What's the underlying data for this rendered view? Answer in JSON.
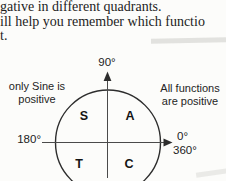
{
  "page": {
    "background": "#fcfcfa",
    "text_color": "#1d1d1d"
  },
  "paragraph": {
    "line1": "gative in different quadrants.",
    "line2": "ill help you remember which functio",
    "line3": "t."
  },
  "diagram": {
    "axis_labels": {
      "top": "90°",
      "left": "180°",
      "right_upper": "0°",
      "right_lower": "360°"
    },
    "annotations": {
      "left_line1": "only Sine is",
      "left_line2": "positive",
      "right_line1": "All functions",
      "right_line2": "are positive"
    },
    "quadrants": {
      "q2_upper_left": "S",
      "q1_upper_right": "A",
      "q3_lower_left": "T",
      "q4_lower_right": "C"
    },
    "colors": {
      "circle_stroke": "#2d2d2d",
      "axis_stroke": "#4a4a4a",
      "label_color": "#222222"
    }
  }
}
